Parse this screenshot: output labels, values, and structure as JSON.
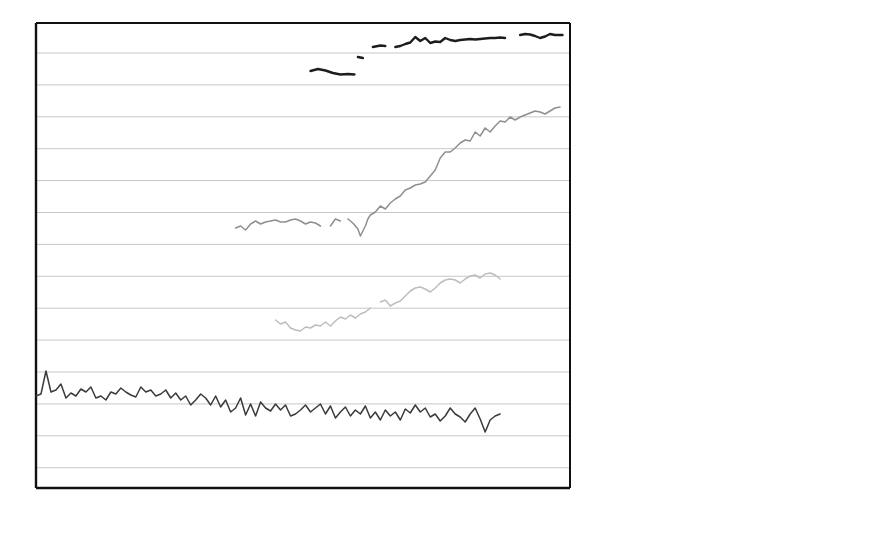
{
  "axes": {
    "ylabel": "Sea-level records",
    "scale_bar_label": "250mm",
    "scale_bar_value_mm": 250,
    "xticks": [
      "1900",
      "1920",
      "1940",
      "1960",
      "1980",
      "2000"
    ],
    "xlim": [
      1900,
      2007
    ],
    "grid": true,
    "gridline_spacing_mm": 250,
    "y_axis_ticklabels": []
  },
  "annotations": [
    {
      "name": "earthquake-annotation",
      "text": "1964 Earthquake",
      "x_year": 1964,
      "arrow": "left"
    },
    {
      "name": "groundwater-annotation",
      "text_line1": "1960's increased",
      "text_line2": "groundwater extraction",
      "x_year": 1965,
      "arrow": "left"
    }
  ],
  "legend": {
    "items": [
      {
        "name": "Nezugaseki, Japan",
        "sep": "  -  ",
        "desc": "Abrupt change, earthquake (instantaneous rise of 22cm in 1964)",
        "line1": "Nezugaseki, Japan  - Abrupt",
        "line2": "change, earthquake (instantaneous",
        "line3": "rise of 22cm in 1964)",
        "color": "#1d1d1d",
        "width": 2.6
      },
      {
        "name": "Bangkok, Thailand",
        "sep": "  -  ",
        "desc": "Accelerated rise, increasing human induced subsidence (post 1960 - 17.5mm/yr)",
        "line1": "Bangkok, Thailand  - Accelerated",
        "line2": "rise, increasing human induced",
        "line3": "subsidence (post 1960 - 17.5mm/yr)",
        "color": "#8f8f8f",
        "width": 1.9
      },
      {
        "name": "Grand Isle, USA",
        "sep": "  -  ",
        "desc": "Rapid rise, natural deltaic plain subsidence (6.9mm/yr)",
        "line1": "Grand Isle, USA  - Rapid rise,",
        "line2": "natural deltaic plain subsidence",
        "line3": "(6.9mm/yr)",
        "color": "#bdbdbd",
        "width": 1.9
      },
      {
        "name": "Helsinki, Finland",
        "sep": "  -  ",
        "desc": "Falling trend, natural land uplift exceeds global-mean rise (-2.5mm/yr)",
        "line1": "Helsinki, Finland  - Falling trend,",
        "line2": "natural land uplift exceeds global-",
        "line3": "mean rise (–2.5mm/yr)",
        "color": "#3a3a3a",
        "width": 2.2
      },
      {
        "name": "Sydney, Australia",
        "sep": "  -  ",
        "desc": "Gradual rise (0.5mm/yr)",
        "line1": "Sydney, Australia  - Gradual rise",
        "line2": "(0.5mm/yr)",
        "line3": "",
        "color": "#6e6e6e",
        "width": 2.0
      }
    ]
  },
  "chart_data": {
    "type": "line",
    "title": "",
    "xlabel": "",
    "ylabel": "Sea-level records",
    "xlim": [
      1900,
      2007
    ],
    "grid": true,
    "legend_position": "right",
    "note": "Stacked sea-level station records with arbitrary vertical offsets; vertical scale bar = 250mm per gridline interval. y values below are in pixel-space of the original figure (smaller y = higher sea level).",
    "series": [
      {
        "name": "Nezugaseki, Japan",
        "color": "#1d1d1d",
        "rate_mm_per_yr": null,
        "note": "Abrupt change, earthquake (instantaneous rise of 22cm in 1964)",
        "segments": [
          {
            "label": "pre-earthquake",
            "x": [
              1955,
              1956.5,
              1958,
              1959.5,
              1961,
              1962.5,
              1963.8
            ],
            "y": [
              71,
              69,
              70.5,
              73,
              74.5,
              74,
              74.5
            ]
          },
          {
            "label": "post-earthquake-a",
            "x": [
              1964.5,
              1965.5
            ],
            "y": [
              57,
              58
            ]
          },
          {
            "label": "post-earthquake-b",
            "x": [
              1967.5,
              1969,
              1970
            ],
            "y": [
              47,
              45.5,
              46
            ]
          },
          {
            "label": "post-earthquake-c",
            "x": [
              1972,
              1973,
              1974,
              1975,
              1976,
              1977,
              1978,
              1979,
              1980,
              1981,
              1982,
              1983,
              1984,
              1985,
              1986,
              1987,
              1988,
              1989,
              1990,
              1991,
              1992,
              1993,
              1994
            ],
            "y": [
              47,
              46,
              44,
              42.5,
              37,
              41,
              38,
              43,
              41.5,
              42,
              38,
              40,
              41,
              40,
              39.5,
              39,
              39.5,
              39,
              38.5,
              38,
              38,
              37.5,
              38
            ]
          },
          {
            "label": "post-earthquake-d",
            "x": [
              1997,
              1998,
              1999,
              2000,
              2001,
              2002,
              2003,
              2004,
              2005.5
            ],
            "y": [
              35,
              34,
              34.5,
              36,
              38,
              36.5,
              34,
              35,
              35
            ]
          }
        ]
      },
      {
        "name": "Bangkok, Thailand",
        "color": "#8f8f8f",
        "rate_mm_per_yr": 17.5,
        "note": "Accelerated rise, increasing human induced subsidence (post 1960 - 17.5mm/yr)",
        "segments": [
          {
            "label": "early",
            "x": [
              1940,
              1941,
              1942,
              1943,
              1944,
              1945,
              1946,
              1947,
              1948,
              1949,
              1950,
              1951,
              1952,
              1953,
              1954,
              1955,
              1956,
              1957
            ],
            "y": [
              228,
              226,
              230,
              224,
              221,
              224,
              222,
              221,
              220,
              222,
              222,
              220,
              219,
              221,
              224,
              222,
              223,
              226
            ]
          },
          {
            "label": "gap1",
            "x": [
              1959,
              1960,
              1961
            ],
            "y": [
              226,
              219,
              221
            ]
          },
          {
            "label": "late",
            "x": [
              1962.5,
              1963.5,
              1964.5,
              1965,
              1965.5,
              1966,
              1966.5,
              1967,
              1968,
              1969,
              1970,
              1971,
              1972,
              1973,
              1974,
              1975,
              1976,
              1977,
              1978,
              1979,
              1980,
              1981,
              1982,
              1983,
              1984,
              1985,
              1986,
              1987,
              1988,
              1989,
              1990,
              1991,
              1992,
              1993,
              1994,
              1995,
              1996,
              1997,
              1998,
              1999,
              2000,
              2001,
              2002,
              2003,
              2004,
              2005
            ],
            "y": [
              219,
              223,
              229,
              236,
              231,
              226,
              219,
              215,
              212,
              206,
              209,
              203,
              199,
              196,
              190,
              188,
              185,
              184,
              182,
              176,
              170,
              158,
              152,
              152,
              148,
              143,
              140,
              141,
              132,
              136,
              128,
              132,
              126,
              121,
              122,
              117,
              120,
              117,
              115,
              113,
              111,
              112,
              114,
              111,
              108,
              107
            ]
          }
        ]
      },
      {
        "name": "Grand Isle, USA",
        "color": "#bdbdbd",
        "rate_mm_per_yr": 6.9,
        "note": "Rapid rise, natural deltaic plain subsidence (6.9mm/yr)",
        "segments": [
          {
            "label": "early",
            "x": [
              1948,
              1949,
              1950,
              1951,
              1952,
              1953,
              1954,
              1955,
              1956,
              1957,
              1958,
              1959,
              1960,
              1961,
              1962,
              1963,
              1964,
              1965,
              1966,
              1967
            ],
            "y": [
              320,
              324,
              322,
              328,
              330,
              331,
              327,
              328,
              325,
              326,
              322,
              326,
              321,
              317,
              319,
              315,
              318,
              314,
              312,
              308
            ]
          },
          {
            "label": "gap",
            "x": [
              1969,
              1970,
              1971,
              1972,
              1973,
              1974,
              1975,
              1976,
              1977,
              1978,
              1979,
              1980,
              1981,
              1982,
              1983,
              1984,
              1985,
              1986,
              1987,
              1988,
              1989,
              1990,
              1991,
              1992,
              1993
            ],
            "y": [
              302,
              300,
              306,
              303,
              301,
              296,
              291,
              288,
              287,
              289,
              292,
              288,
              283,
              280,
              279,
              280,
              283,
              279,
              276,
              275,
              278,
              274,
              273,
              275,
              279
            ]
          }
        ]
      },
      {
        "name": "Helsinki, Finland",
        "color": "#3a3a3a",
        "rate_mm_per_yr": -2.5,
        "note": "Falling trend, natural land uplift exceeds global-mean rise (-2.5mm/yr)",
        "segments": [
          {
            "label": "full",
            "x": [
              1900,
              1901,
              1902,
              1903,
              1904,
              1905,
              1906,
              1907,
              1908,
              1909,
              1910,
              1911,
              1912,
              1913,
              1914,
              1915,
              1916,
              1917,
              1918,
              1919,
              1920,
              1921,
              1922,
              1923,
              1924,
              1925,
              1926,
              1927,
              1928,
              1929,
              1930,
              1931,
              1932,
              1933,
              1934,
              1935,
              1936,
              1937,
              1938,
              1939,
              1940,
              1941,
              1942,
              1943,
              1944,
              1945,
              1946,
              1947,
              1948,
              1949,
              1950,
              1951,
              1952,
              1953,
              1954,
              1955,
              1956,
              1957,
              1958,
              1959,
              1960,
              1961,
              1962,
              1963,
              1964,
              1965,
              1966,
              1967,
              1968,
              1969,
              1970,
              1971,
              1972,
              1973,
              1974,
              1975,
              1976,
              1977,
              1978,
              1979,
              1980,
              1981,
              1982,
              1983,
              1984,
              1985,
              1986,
              1987,
              1988,
              1989,
              1990,
              1991,
              1992,
              1993
            ],
            "y": [
              396,
              394,
              371,
              392,
              390,
              384,
              398,
              393,
              396,
              389,
              392,
              387,
              398,
              396,
              400,
              392,
              394,
              388,
              392,
              395,
              397,
              387,
              392,
              390,
              396,
              394,
              390,
              398,
              393,
              400,
              396,
              405,
              400,
              394,
              398,
              405,
              396,
              407,
              400,
              412,
              408,
              398,
              415,
              404,
              416,
              402,
              408,
              411,
              404,
              410,
              405,
              416,
              414,
              410,
              405,
              412,
              408,
              404,
              414,
              406,
              418,
              412,
              407,
              416,
              410,
              414,
              406,
              418,
              412,
              420,
              410,
              416,
              412,
              420,
              409,
              413,
              405,
              412,
              408,
              417,
              414,
              421,
              416,
              408,
              414,
              417,
              422,
              414,
              408,
              419,
              432,
              420,
              416,
              414
            ]
          }
        ]
      },
      {
        "name": "Sydney, Australia",
        "color": "#6e6e6e",
        "rate_mm_per_yr": 0.5,
        "note": "Gradual rise (0.5mm/yr)",
        "segments": [
          {
            "label": "full",
            "x": [
              1900,
              1901,
              1902,
              1903,
              1904,
              1905,
              1906,
              1907,
              1908,
              1909,
              1910,
              1911,
              1912,
              1913,
              1914,
              1915,
              1916,
              1917,
              1918,
              1919,
              1920,
              1921,
              1922,
              1923,
              1924,
              1925,
              1926,
              1927,
              1928,
              1929,
              1930,
              1931,
              1932,
              1933,
              1934,
              1935,
              1936,
              1937,
              1938,
              1939,
              1940,
              1941,
              1942,
              1943,
              1944,
              1945,
              1946,
              1947,
              1948,
              1949,
              1950,
              1951,
              1952,
              1953,
              1954,
              1955,
              1956,
              1957,
              1958,
              1959,
              1960,
              1961,
              1962,
              1963,
              1964,
              1965,
              1966,
              1967,
              1968,
              1969,
              1970,
              1971,
              1972,
              1973,
              1974,
              1975,
              1976,
              1977,
              1978,
              1979,
              1980,
              1981,
              1982,
              1983,
              1984,
              1985,
              1986,
              1987,
              1988,
              1989,
              1990,
              1991,
              1992,
              1993
            ],
            "y": [
              484,
              486,
              485,
              484,
              483,
              482,
              483,
              481,
              478,
              477,
              478,
              480,
              479,
              478,
              481,
              477,
              487,
              478,
              484,
              482,
              483,
              484,
              485,
              486,
              485,
              484,
              483,
              482,
              483,
              484,
              483,
              482,
              483,
              484,
              483,
              482,
              481,
              483,
              482,
              480,
              481,
              480,
              479,
              481,
              480,
              477,
              476,
              478,
              477,
              476,
              477,
              478,
              477,
              476,
              478,
              477,
              475,
              476,
              477,
              476,
              478,
              474,
              476,
              475,
              477,
              473,
              474,
              476,
              475,
              477,
              476,
              478,
              477,
              479,
              481,
              477,
              474,
              473,
              475,
              474,
              476,
              473,
              475,
              477,
              479,
              478,
              480
            ]
          }
        ]
      }
    ]
  }
}
